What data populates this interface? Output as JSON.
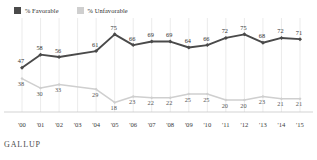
{
  "legend": {
    "items": [
      {
        "label": "% Favorable",
        "color": "#4a4a4a",
        "key": "favorable"
      },
      {
        "label": "% Unfavorable",
        "color": "#cfcfcf",
        "key": "unfavorable"
      }
    ]
  },
  "footer": {
    "brand": "GALLUP"
  },
  "chart_data": {
    "type": "line",
    "title": "",
    "xlabel": "",
    "ylabel": "",
    "ylim": [
      0,
      100
    ],
    "grid": "vertical",
    "legend_position": "top-left",
    "categories": [
      "'00",
      "'01",
      "'02",
      "'03",
      "'04",
      "'05",
      "'06",
      "'07",
      "'08",
      "'09",
      "'10",
      "'11",
      "'12",
      "'13",
      "'14",
      "'15"
    ],
    "series": [
      {
        "name": "% Favorable",
        "color": "#4a4a4a",
        "values": [
          47,
          58,
          56,
          null,
          61,
          75,
          66,
          69,
          69,
          64,
          66,
          72,
          75,
          68,
          72,
          71
        ],
        "labels": [
          "47",
          "58",
          "56",
          "",
          "61",
          "75",
          "66",
          "69",
          "69",
          "64",
          "66",
          "72",
          "75",
          "68",
          "72",
          "71"
        ]
      },
      {
        "name": "% Unfavorable",
        "color": "#cfcfcf",
        "values": [
          38,
          30,
          33,
          null,
          29,
          18,
          23,
          22,
          22,
          25,
          25,
          20,
          20,
          23,
          21,
          21
        ],
        "labels": [
          "38",
          "30",
          "33",
          "",
          "29",
          "18",
          "23",
          "22",
          "22",
          "25",
          "25",
          "20",
          "20",
          "23",
          "21",
          "21"
        ]
      }
    ]
  }
}
